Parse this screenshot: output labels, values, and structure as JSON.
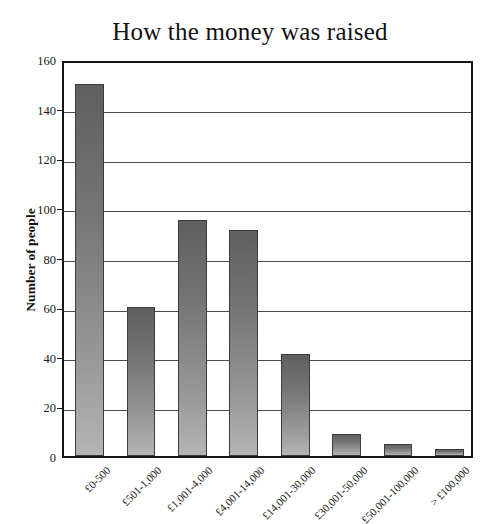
{
  "chart_data": {
    "type": "bar",
    "title": "How the money was raised",
    "xlabel": "",
    "ylabel": "Number of people",
    "categories": [
      "£0-500",
      "£501-1,000",
      "£1,001-4,000",
      "£4,001-14,000",
      "£14,001-30,000",
      "£30,001-50,000",
      "£50,001-100,000",
      "> £100,000"
    ],
    "values": [
      150,
      60,
      95,
      91,
      41,
      9,
      5,
      3
    ],
    "ylim": [
      0,
      160
    ],
    "ytick_values": [
      0,
      20,
      40,
      60,
      80,
      100,
      120,
      140,
      160
    ],
    "ytick_labels": [
      "0",
      "20",
      "40",
      "60",
      "80",
      "100",
      "120",
      "140",
      "160"
    ],
    "grid": true,
    "legend": false,
    "bar_color_top": "#5f5f5f",
    "bar_color_bottom": "#b4b4b4",
    "bar_edge_color": "#3b3b3b",
    "axis_color": "#161616",
    "background_color": "#ffffff",
    "label_rotation_degrees": -45
  }
}
